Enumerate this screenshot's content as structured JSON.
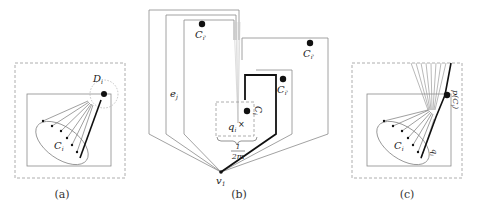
{
  "figure": {
    "panels": [
      {
        "id": "a",
        "caption": "(a)",
        "labels": {
          "disk": "D",
          "disk_sub": "i",
          "cluster": "C",
          "cluster_sub": "i"
        }
      },
      {
        "id": "b",
        "caption": "(b)",
        "labels": {
          "cluster_top": "C",
          "cluster_top_sub": "i'",
          "cluster_right": "C",
          "cluster_right_sub": "i'",
          "cluster_inner": "C",
          "cluster_inner_sub": "i'",
          "cluster_center": "C",
          "cluster_center_sub": "i",
          "edge": "e",
          "edge_sub": "j",
          "point": "q",
          "point_sub": "i",
          "point_marker": "×",
          "width_num": "1",
          "width_den": "2m",
          "vertex": "v",
          "vertex_sub": "1"
        }
      },
      {
        "id": "c",
        "caption": "(c)",
        "labels": {
          "cluster": "C",
          "cluster_sub": "i",
          "point": "q",
          "point_sub": "i",
          "projection": "p(C",
          "projection_sub": "i",
          "projection_close": ")"
        }
      }
    ],
    "colors": {
      "stroke": "#8a8a8a",
      "stroke_light": "#b5b5b5",
      "bold": "#111111",
      "dashed": "#9a9a9a",
      "dot": "#111111"
    }
  }
}
